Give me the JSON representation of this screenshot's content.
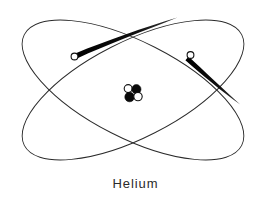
{
  "figure": {
    "title": "Helium",
    "caption": "Helium",
    "element_name": "Helium",
    "element_symbol": "He",
    "model": "Bohr planetary model",
    "background_color": "#ffffff",
    "line_color": "#2b2b2b",
    "trail_color": "#000000",
    "electron_fill_color": "#ffffff",
    "nucleus_dark_color": "#0a0a0a",
    "nucleus_light_color": "#ffffff",
    "width": 271,
    "height": 200
  },
  "orbits": [
    {
      "name": "orbit-1",
      "label": "electron orbit 1",
      "cx": 133,
      "cy": 90,
      "rx": 122,
      "ry": 48,
      "rotation": 27,
      "stroke_width": 0.9,
      "color": "#2b2b2b"
    },
    {
      "name": "orbit-2",
      "label": "electron orbit 2",
      "cx": 133,
      "cy": 90,
      "rx": 122,
      "ry": 48,
      "rotation": -27,
      "stroke_width": 0.9,
      "color": "#2b2b2b"
    }
  ],
  "electrons": [
    {
      "name": "electron-left",
      "label": "electron",
      "charge": "-",
      "cx": 74.5,
      "cy": 56.5,
      "r": 3.4,
      "fill": "#ffffff",
      "stroke": "#111111",
      "trail": {
        "from_x": 76,
        "from_y": 55,
        "to_x": 177,
        "to_y": 18,
        "start_width": 5.0,
        "end_width": 0.6
      }
    },
    {
      "name": "electron-right",
      "label": "electron",
      "charge": "-",
      "cx": 190.5,
      "cy": 55.0,
      "r": 3.4,
      "fill": "#ffffff",
      "stroke": "#111111",
      "trail": {
        "from_x": 192,
        "from_y": 57,
        "to_x": 240,
        "to_y": 104,
        "start_width": 5.0,
        "end_width": 0.6
      }
    }
  ],
  "nucleus": {
    "name": "nucleus",
    "label": "helium nucleus",
    "center_x": 133,
    "center_y": 94,
    "particle_counts": {
      "protons": 2,
      "neutrons": 2
    },
    "particles": [
      {
        "name": "nucleus-particle-neutron-upper-left",
        "type": "neutron",
        "cx": 128.2,
        "cy": 88.6,
        "r": 4.0,
        "fill": "#ffffff",
        "stroke": "#141414"
      },
      {
        "name": "nucleus-particle-proton-upper-right",
        "type": "proton",
        "cx": 136.4,
        "cy": 89.2,
        "r": 4.6,
        "fill": "#0a0a0a",
        "stroke": "#0a0a0a"
      },
      {
        "name": "nucleus-particle-proton-lower-left",
        "type": "proton",
        "cx": 129.6,
        "cy": 97.0,
        "r": 4.8,
        "fill": "#0a0a0a",
        "stroke": "#0a0a0a"
      },
      {
        "name": "nucleus-particle-neutron-lower-right",
        "type": "neutron",
        "cx": 138.0,
        "cy": 96.6,
        "r": 4.2,
        "fill": "#ffffff",
        "stroke": "#141414"
      }
    ]
  }
}
